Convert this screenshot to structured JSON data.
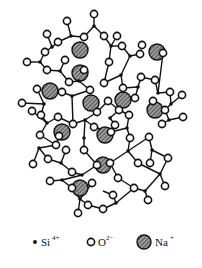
{
  "figure": {
    "legend": [
      {
        "symbol": "si-dot",
        "label": "Si",
        "charge": "4+"
      },
      {
        "symbol": "o-ring",
        "label": "O",
        "charge": "2−"
      },
      {
        "symbol": "na-hatched",
        "label": "Na",
        "charge": "+"
      }
    ],
    "colors": {
      "stroke": "#111111",
      "na_fill": "#6e6e6e",
      "background": "#ffffff"
    },
    "si_nodes": [
      [
        94,
        26
      ],
      [
        71,
        36
      ],
      [
        52,
        47
      ],
      [
        40,
        62
      ],
      [
        60,
        71
      ],
      [
        79,
        81
      ],
      [
        72,
        96
      ],
      [
        111,
        46
      ],
      [
        130,
        56
      ],
      [
        121,
        75
      ],
      [
        138,
        87
      ],
      [
        158,
        93
      ],
      [
        171,
        104
      ],
      [
        169,
        120
      ],
      [
        44,
        104
      ],
      [
        47,
        123
      ],
      [
        59,
        136
      ],
      [
        85,
        120
      ],
      [
        84,
        138
      ],
      [
        110,
        118
      ],
      [
        127,
        128
      ],
      [
        39,
        148
      ],
      [
        61,
        163
      ],
      [
        82,
        175
      ],
      [
        62,
        180
      ],
      [
        80,
        199
      ],
      [
        103,
        191
      ],
      [
        116,
        203
      ],
      [
        145,
        191
      ],
      [
        160,
        174
      ],
      [
        152,
        150
      ],
      [
        128,
        151
      ],
      [
        103,
        157
      ],
      [
        90,
        112
      ]
    ],
    "o_nodes": [
      [
        94,
        14
      ],
      [
        67,
        21
      ],
      [
        104,
        36
      ],
      [
        84,
        37
      ],
      [
        47,
        34
      ],
      [
        58,
        42
      ],
      [
        45,
        52
      ],
      [
        27,
        62
      ],
      [
        47,
        70
      ],
      [
        65,
        60
      ],
      [
        69,
        82
      ],
      [
        53,
        80
      ],
      [
        84,
        70
      ],
      [
        90,
        90
      ],
      [
        62,
        92
      ],
      [
        117,
        36
      ],
      [
        122,
        46
      ],
      [
        109,
        62
      ],
      [
        104,
        83
      ],
      [
        140,
        54
      ],
      [
        142,
        45
      ],
      [
        123,
        88
      ],
      [
        163,
        53
      ],
      [
        141,
        77
      ],
      [
        135,
        98
      ],
      [
        155,
        80
      ],
      [
        170,
        92
      ],
      [
        182,
        95
      ],
      [
        165,
        110
      ],
      [
        183,
        117
      ],
      [
        162,
        124
      ],
      [
        153,
        101
      ],
      [
        37,
        89
      ],
      [
        22,
        103
      ],
      [
        32,
        111
      ],
      [
        41,
        115
      ],
      [
        58,
        117
      ],
      [
        73,
        124
      ],
      [
        56,
        145
      ],
      [
        40,
        135
      ],
      [
        97,
        112
      ],
      [
        108,
        101
      ],
      [
        94,
        127
      ],
      [
        111,
        132
      ],
      [
        119,
        110
      ],
      [
        130,
        138
      ],
      [
        84,
        150
      ],
      [
        115,
        125
      ],
      [
        129,
        115
      ],
      [
        33,
        164
      ],
      [
        48,
        159
      ],
      [
        66,
        150
      ],
      [
        72,
        172
      ],
      [
        50,
        181
      ],
      [
        72,
        188
      ],
      [
        92,
        183
      ],
      [
        88,
        205
      ],
      [
        78,
        213
      ],
      [
        103,
        209
      ],
      [
        113,
        195
      ],
      [
        118,
        178
      ],
      [
        134,
        188
      ],
      [
        148,
        200
      ],
      [
        150,
        163
      ],
      [
        165,
        186
      ],
      [
        110,
        163
      ],
      [
        97,
        165
      ],
      [
        149,
        137
      ],
      [
        138,
        163
      ],
      [
        168,
        158
      ]
    ],
    "na_ions": [
      [
        80,
        50,
        8
      ],
      [
        157,
        52,
        8
      ],
      [
        80,
        73,
        8
      ],
      [
        50,
        91,
        8
      ],
      [
        91,
        103,
        8
      ],
      [
        123,
        100,
        8
      ],
      [
        155,
        110,
        8
      ],
      [
        62,
        132,
        8
      ],
      [
        105,
        135,
        8
      ],
      [
        103,
        165,
        8
      ],
      [
        80,
        188,
        8
      ]
    ]
  }
}
